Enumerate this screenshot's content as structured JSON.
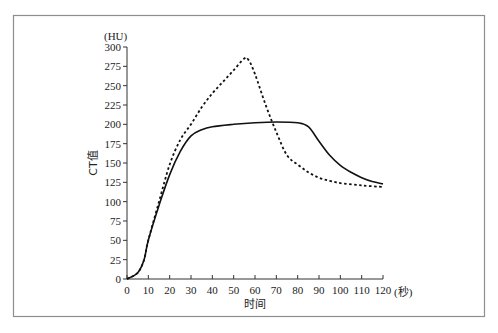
{
  "chart_data": {
    "type": "line",
    "title": "",
    "xlabel": "时间",
    "x_unit": "(秒)",
    "ylabel": "CT值",
    "y_unit": "(HU)",
    "xlim": [
      0,
      120
    ],
    "ylim": [
      0,
      300
    ],
    "x_ticks": [
      0,
      10,
      20,
      30,
      40,
      50,
      60,
      70,
      80,
      90,
      100,
      110,
      120
    ],
    "y_ticks": [
      0,
      25,
      50,
      75,
      100,
      125,
      150,
      175,
      200,
      225,
      250,
      275,
      300
    ],
    "grid": false,
    "legend": null,
    "series": [
      {
        "name": "solid",
        "style": "solid",
        "x": [
          0,
          5,
          8,
          10,
          15,
          20,
          25,
          30,
          35,
          40,
          50,
          60,
          70,
          80,
          85,
          90,
          95,
          100,
          105,
          110,
          115,
          120
        ],
        "values": [
          0,
          8,
          25,
          50,
          95,
          135,
          165,
          185,
          193,
          197,
          200,
          202,
          203,
          202,
          197,
          178,
          160,
          147,
          138,
          131,
          126,
          123
        ]
      },
      {
        "name": "dashed",
        "style": "dashed",
        "x": [
          0,
          5,
          8,
          10,
          15,
          20,
          25,
          30,
          35,
          40,
          45,
          50,
          55,
          57,
          60,
          65,
          70,
          75,
          80,
          85,
          90,
          95,
          100,
          110,
          120
        ],
        "values": [
          0,
          8,
          25,
          50,
          100,
          148,
          180,
          200,
          222,
          240,
          255,
          270,
          285,
          283,
          265,
          225,
          190,
          160,
          148,
          138,
          131,
          127,
          124,
          121,
          119
        ]
      }
    ]
  }
}
